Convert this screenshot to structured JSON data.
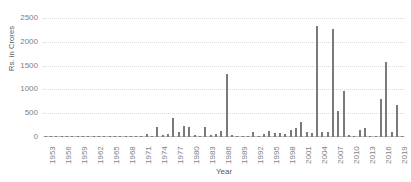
{
  "chart_data": {
    "type": "bar",
    "title": "",
    "xlabel": "Year",
    "ylabel": "Rs. in Crores",
    "ylim": [
      0,
      2500
    ],
    "yticks": [
      0,
      500,
      1000,
      1500,
      2000,
      2500
    ],
    "ytick_labels": [
      "0",
      "500",
      "1000",
      "1500",
      "2000",
      "2500"
    ],
    "grid": true,
    "legend": "none",
    "bar_color": "#7a7a7a",
    "gridline_color": "#d9d9d9",
    "xtick_labels": [
      "1953",
      "1956",
      "1959",
      "1962",
      "1965",
      "1968",
      "1971",
      "1974",
      "1977",
      "1980",
      "1983",
      "1986",
      "1989",
      "1992",
      "1995",
      "1998",
      "2001",
      "2004",
      "2007",
      "2010",
      "2013",
      "2016",
      "2019"
    ],
    "xtick_step": 3,
    "categories": [
      1953,
      1954,
      1955,
      1956,
      1957,
      1958,
      1959,
      1960,
      1961,
      1962,
      1963,
      1964,
      1965,
      1966,
      1967,
      1968,
      1969,
      1970,
      1971,
      1972,
      1973,
      1974,
      1975,
      1976,
      1977,
      1978,
      1979,
      1980,
      1981,
      1982,
      1983,
      1984,
      1985,
      1986,
      1987,
      1988,
      1989,
      1990,
      1991,
      1992,
      1993,
      1994,
      1995,
      1996,
      1997,
      1998,
      1999,
      2000,
      2001,
      2002,
      2003,
      2004,
      2005,
      2006,
      2007,
      2008,
      2009,
      2010,
      2011,
      2012,
      2013,
      2014,
      2015,
      2016,
      2017,
      2018,
      2019,
      2020
    ],
    "values": [
      8,
      10,
      12,
      6,
      5,
      4,
      3,
      5,
      4,
      6,
      5,
      4,
      5,
      8,
      6,
      4,
      12,
      15,
      10,
      55,
      30,
      215,
      45,
      60,
      400,
      95,
      240,
      210,
      40,
      30,
      200,
      45,
      60,
      120,
      1330,
      35,
      8,
      12,
      15,
      110,
      25,
      70,
      130,
      90,
      75,
      60,
      155,
      195,
      320,
      95,
      85,
      2340,
      95,
      110,
      2270,
      540,
      960,
      35,
      30,
      145,
      195,
      30,
      25,
      790,
      1570,
      95,
      680,
      20
    ]
  }
}
